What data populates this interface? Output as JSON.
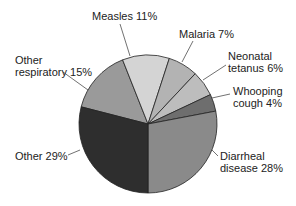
{
  "chart_data": {
    "type": "pie",
    "title": "",
    "start_angle_deg": -75.6,
    "direction": "clockwise",
    "slices": [
      {
        "label": "Other respiratory",
        "value": 15,
        "color": "#9a9a9a"
      },
      {
        "label": "Measles",
        "value": 11,
        "color": "#d4d4d4"
      },
      {
        "label": "Malaria",
        "value": 7,
        "color": "#b3b3b3"
      },
      {
        "label": "Neonatal tetanus",
        "value": 6,
        "color": "#bdbdbd"
      },
      {
        "label": "Whooping cough",
        "value": 4,
        "color": "#6e6e6e"
      },
      {
        "label": "Diarrheal disease",
        "value": 28,
        "color": "#8a8a8a"
      },
      {
        "label": "Other",
        "value": 29,
        "color": "#2e2e2e"
      }
    ]
  },
  "labels": {
    "measles": "Measles 11%",
    "malaria": "Malaria 7%",
    "neonatal_1": "Neonatal",
    "neonatal_2": "tetanus 6%",
    "whooping_1": "Whooping",
    "whooping_2": "cough 4%",
    "other_resp_1": "Other",
    "other_resp_2": "respiratory 15%",
    "other": "Other 29%",
    "diarrheal_1": "Diarrheal",
    "diarrheal_2": "disease 28%"
  }
}
